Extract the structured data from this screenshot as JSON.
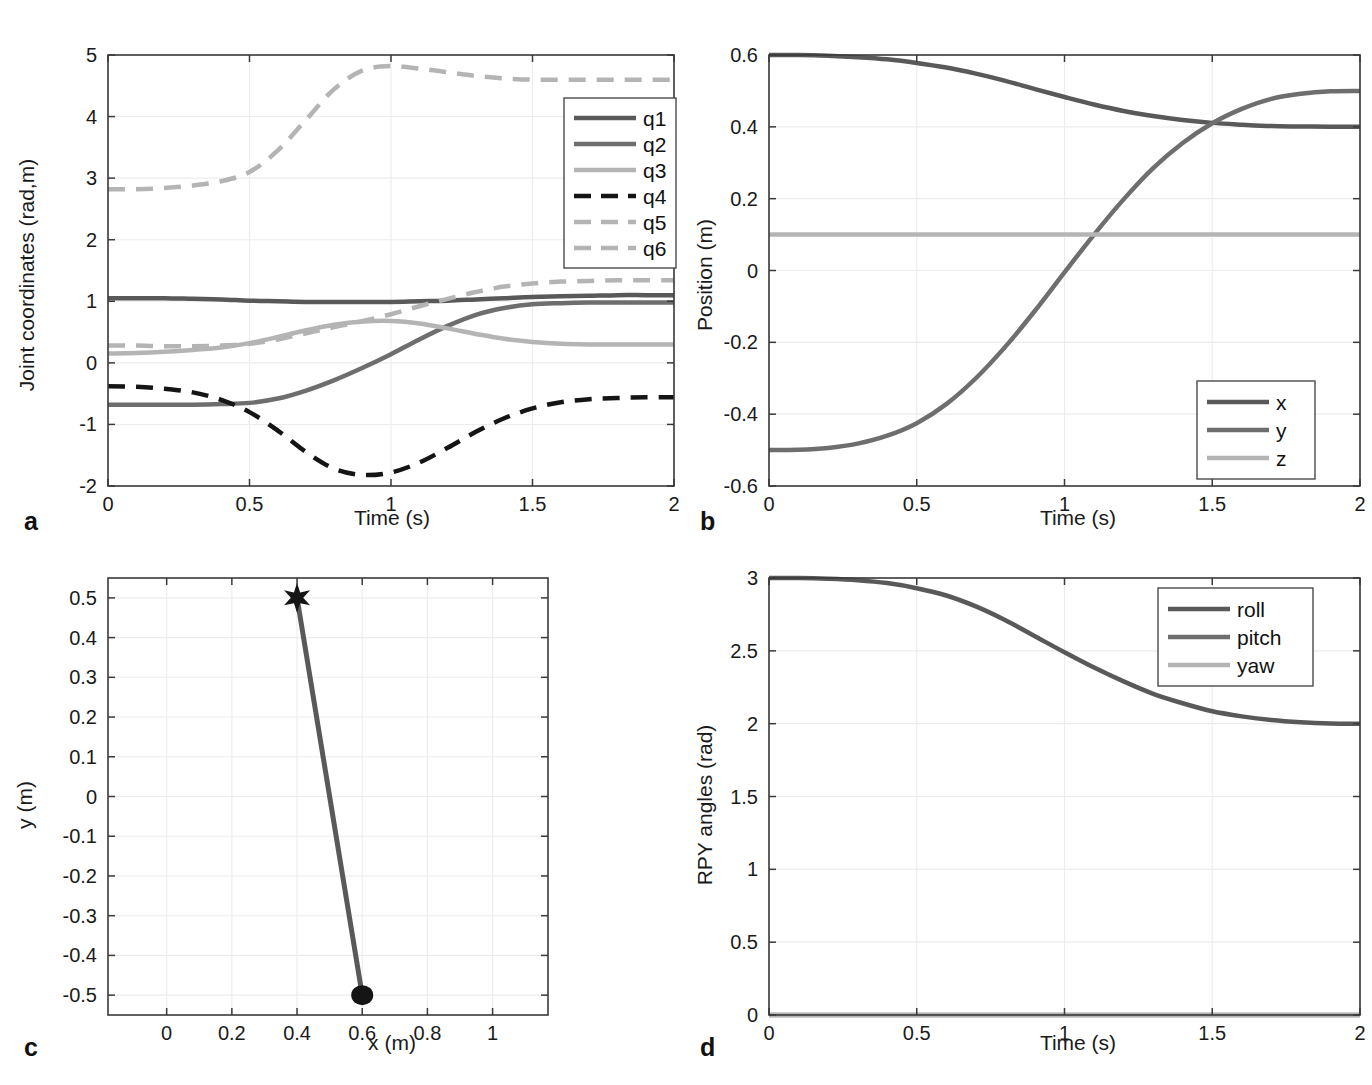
{
  "figure": {
    "panels": [
      "a",
      "b",
      "c",
      "d"
    ]
  },
  "colors": {
    "dark_gray": "#595959",
    "mid_gray": "#6e6e6e",
    "light_gray": "#b4b4b4",
    "black": "#151515",
    "axis": "#3a3a3a",
    "grid": "#ececec"
  },
  "panel_a": {
    "tag": "a",
    "xlabel": "Time (s)",
    "ylabel": "Joint coordinates (rad,m)",
    "xticks": [
      "0",
      "0.5",
      "1",
      "1.5",
      "2"
    ],
    "yticks": [
      "-2",
      "-1",
      "0",
      "1",
      "2",
      "3",
      "4",
      "5"
    ],
    "legend": [
      "q1",
      "q2",
      "q3",
      "q4",
      "q5",
      "q6"
    ]
  },
  "panel_b": {
    "tag": "b",
    "xlabel": "Time (s)",
    "ylabel": "Position (m)",
    "xticks": [
      "0",
      "0.5",
      "1",
      "1.5",
      "2"
    ],
    "yticks": [
      "-0.6",
      "-0.4",
      "-0.2",
      "0",
      "0.2",
      "0.4",
      "0.6"
    ],
    "legend": [
      "x",
      "y",
      "z"
    ]
  },
  "panel_c": {
    "tag": "c",
    "xlabel": "x (m)",
    "ylabel": "y (m)",
    "xticks": [
      "0",
      "0.2",
      "0.4",
      "0.6",
      "0.8",
      "1"
    ],
    "yticks": [
      "-0.5",
      "-0.4",
      "-0.3",
      "-0.2",
      "-0.1",
      "0",
      "0.1",
      "0.2",
      "0.3",
      "0.4",
      "0.5"
    ],
    "markers": [
      {
        "name": "start-star",
        "shape": "star",
        "x": 0.4,
        "y": 0.5
      },
      {
        "name": "end-circle",
        "shape": "circle",
        "x": 0.6,
        "y": -0.5
      }
    ]
  },
  "panel_d": {
    "tag": "d",
    "xlabel": "Time (s)",
    "ylabel": "RPY angles (rad)",
    "xticks": [
      "0",
      "0.5",
      "1",
      "1.5",
      "2"
    ],
    "yticks": [
      "0",
      "0.5",
      "1",
      "1.5",
      "2",
      "2.5",
      "3"
    ],
    "legend": [
      "roll",
      "pitch",
      "yaw"
    ]
  },
  "chart_data": [
    {
      "id": "panel_a",
      "type": "line",
      "title": "",
      "xlabel": "Time (s)",
      "ylabel": "Joint coordinates (rad,m)",
      "xlim": [
        0,
        2
      ],
      "ylim": [
        -2,
        5
      ],
      "grid": true,
      "legend_position": "upper right",
      "x": [
        0,
        0.1,
        0.2,
        0.3,
        0.4,
        0.5,
        0.6,
        0.7,
        0.8,
        0.9,
        1.0,
        1.1,
        1.2,
        1.3,
        1.4,
        1.5,
        1.6,
        1.7,
        1.8,
        1.9,
        2.0
      ],
      "series": [
        {
          "name": "q1",
          "style": "solid",
          "color": "#595959",
          "values": [
            1.05,
            1.05,
            1.05,
            1.04,
            1.03,
            1.01,
            1.0,
            0.99,
            0.99,
            0.99,
            0.99,
            1.0,
            1.01,
            1.03,
            1.05,
            1.07,
            1.08,
            1.09,
            1.1,
            1.1,
            1.1
          ]
        },
        {
          "name": "q2",
          "style": "solid",
          "color": "#6e6e6e",
          "values": [
            -0.68,
            -0.68,
            -0.68,
            -0.68,
            -0.67,
            -0.65,
            -0.58,
            -0.45,
            -0.28,
            -0.08,
            0.14,
            0.38,
            0.6,
            0.78,
            0.89,
            0.95,
            0.97,
            0.98,
            0.98,
            0.98,
            0.98
          ]
        },
        {
          "name": "q3",
          "style": "solid",
          "color": "#b4b4b4",
          "values": [
            0.15,
            0.16,
            0.18,
            0.21,
            0.25,
            0.32,
            0.42,
            0.53,
            0.62,
            0.67,
            0.68,
            0.64,
            0.56,
            0.47,
            0.39,
            0.34,
            0.31,
            0.3,
            0.3,
            0.3,
            0.3
          ]
        },
        {
          "name": "q4",
          "style": "dashed",
          "color": "#151515",
          "values": [
            -0.38,
            -0.39,
            -0.42,
            -0.48,
            -0.6,
            -0.8,
            -1.1,
            -1.45,
            -1.72,
            -1.82,
            -1.78,
            -1.62,
            -1.38,
            -1.12,
            -0.9,
            -0.74,
            -0.64,
            -0.59,
            -0.57,
            -0.56,
            -0.56
          ]
        },
        {
          "name": "q5",
          "style": "dashed",
          "color": "#b4b4b4",
          "values": [
            2.82,
            2.82,
            2.84,
            2.88,
            2.95,
            3.1,
            3.45,
            3.95,
            4.45,
            4.75,
            4.82,
            4.78,
            4.72,
            4.66,
            4.62,
            4.6,
            4.6,
            4.6,
            4.6,
            4.6,
            4.6
          ]
        },
        {
          "name": "q6",
          "style": "dashed",
          "color": "#b4b4b4",
          "values": [
            0.28,
            0.28,
            0.27,
            0.27,
            0.28,
            0.31,
            0.38,
            0.48,
            0.58,
            0.68,
            0.79,
            0.92,
            1.04,
            1.15,
            1.24,
            1.29,
            1.32,
            1.33,
            1.34,
            1.34,
            1.34
          ]
        }
      ]
    },
    {
      "id": "panel_b",
      "type": "line",
      "title": "",
      "xlabel": "Time (s)",
      "ylabel": "Position (m)",
      "xlim": [
        0,
        2
      ],
      "ylim": [
        -0.6,
        0.6
      ],
      "grid": true,
      "legend_position": "lower right",
      "x": [
        0,
        0.1,
        0.2,
        0.3,
        0.4,
        0.5,
        0.6,
        0.7,
        0.8,
        0.9,
        1.0,
        1.1,
        1.2,
        1.3,
        1.4,
        1.5,
        1.6,
        1.7,
        1.8,
        1.9,
        2.0
      ],
      "series": [
        {
          "name": "x",
          "style": "solid",
          "color": "#595959",
          "values": [
            0.6,
            0.6,
            0.598,
            0.594,
            0.588,
            0.578,
            0.565,
            0.548,
            0.528,
            0.505,
            0.483,
            0.462,
            0.444,
            0.43,
            0.419,
            0.411,
            0.406,
            0.402,
            0.401,
            0.4,
            0.4
          ]
        },
        {
          "name": "y",
          "style": "solid",
          "color": "#6e6e6e",
          "values": [
            -0.5,
            -0.499,
            -0.494,
            -0.482,
            -0.46,
            -0.425,
            -0.372,
            -0.3,
            -0.212,
            -0.112,
            -0.005,
            0.1,
            0.198,
            0.285,
            0.355,
            0.41,
            0.45,
            0.478,
            0.492,
            0.499,
            0.5
          ]
        },
        {
          "name": "z",
          "style": "solid",
          "color": "#b4b4b4",
          "values": [
            0.1,
            0.1,
            0.1,
            0.1,
            0.1,
            0.1,
            0.1,
            0.1,
            0.1,
            0.1,
            0.1,
            0.1,
            0.1,
            0.1,
            0.1,
            0.1,
            0.1,
            0.1,
            0.1,
            0.1,
            0.1
          ]
        }
      ]
    },
    {
      "id": "panel_c",
      "type": "line",
      "title": "",
      "xlabel": "x (m)",
      "ylabel": "y (m)",
      "xlim": [
        -0.18,
        1.17
      ],
      "ylim": [
        -0.55,
        0.55
      ],
      "grid": true,
      "legend_position": "none",
      "series": [
        {
          "name": "path",
          "style": "solid",
          "color": "#595959",
          "x": [
            0.4,
            0.6
          ],
          "values": [
            0.5,
            -0.5
          ]
        }
      ],
      "annotations": [
        {
          "label": "start",
          "marker": "star",
          "x": 0.4,
          "y": 0.5,
          "color": "#151515"
        },
        {
          "label": "goal",
          "marker": "circle",
          "x": 0.6,
          "y": -0.5,
          "color": "#151515"
        }
      ]
    },
    {
      "id": "panel_d",
      "type": "line",
      "title": "",
      "xlabel": "Time (s)",
      "ylabel": "RPY angles (rad)",
      "xlim": [
        0,
        2
      ],
      "ylim": [
        0,
        3
      ],
      "grid": true,
      "legend_position": "upper right",
      "x": [
        0,
        0.1,
        0.2,
        0.3,
        0.4,
        0.5,
        0.6,
        0.7,
        0.8,
        0.9,
        1.0,
        1.1,
        1.2,
        1.3,
        1.4,
        1.5,
        1.6,
        1.7,
        1.8,
        1.9,
        2.0
      ],
      "series": [
        {
          "name": "roll",
          "style": "solid",
          "color": "#595959",
          "values": [
            3.0,
            3.0,
            2.995,
            2.985,
            2.965,
            2.93,
            2.88,
            2.805,
            2.71,
            2.6,
            2.49,
            2.385,
            2.29,
            2.205,
            2.14,
            2.085,
            2.05,
            2.025,
            2.01,
            2.002,
            2.0
          ]
        },
        {
          "name": "pitch",
          "style": "solid",
          "color": "#6e6e6e",
          "values": [
            0,
            0,
            0,
            0,
            0,
            0,
            0,
            0,
            0,
            0,
            0,
            0,
            0,
            0,
            0,
            0,
            0,
            0,
            0,
            0,
            0
          ]
        },
        {
          "name": "yaw",
          "style": "solid",
          "color": "#b4b4b4",
          "values": [
            0,
            0,
            0,
            0,
            0,
            0,
            0,
            0,
            0,
            0,
            0,
            0,
            0,
            0,
            0,
            0,
            0,
            0,
            0,
            0,
            0
          ]
        }
      ]
    }
  ]
}
